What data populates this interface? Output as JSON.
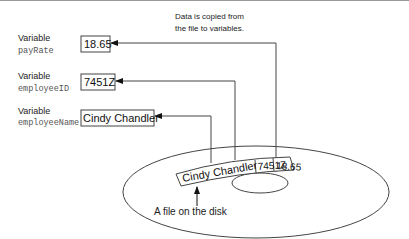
{
  "caption": {
    "line1": "Data is copied from",
    "line2": "the file to variables."
  },
  "variables": [
    {
      "label": "Variable",
      "name": "payRate",
      "value": "18.65"
    },
    {
      "label": "Variable",
      "name": "employeeID",
      "value": "7451Z"
    },
    {
      "label": "Variable",
      "name": "employeeName",
      "value": "Cindy Chandler"
    }
  ],
  "disk": {
    "record": [
      "Cindy Chandler",
      "7451Z",
      "18.65"
    ],
    "label": "A file on the disk"
  }
}
